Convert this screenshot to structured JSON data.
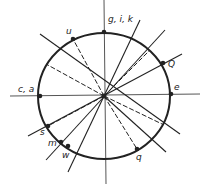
{
  "diagram": {
    "center": [
      104,
      96
    ],
    "radius_x": 66,
    "radius_y": 63,
    "colors": {
      "stroke": "#222222",
      "axis": "#555555",
      "background": "#ffffff"
    },
    "axes": [
      {
        "name": "horizontal-axis",
        "x1": 10,
        "y1": 96,
        "x2": 200,
        "y2": 94
      },
      {
        "name": "vertical-axis",
        "x1": 104,
        "y1": 0,
        "x2": 106,
        "y2": 184
      }
    ],
    "solid_lines": [
      {
        "name": "line-nw-se",
        "x1": 40,
        "y1": 34,
        "x2": 180,
        "y2": 134
      },
      {
        "name": "line-nne-ssw",
        "x1": 140,
        "y1": 20,
        "x2": 68,
        "y2": 172
      },
      {
        "name": "line-ne-sw",
        "x1": 182,
        "y1": 54,
        "x2": 28,
        "y2": 136
      },
      {
        "name": "line-ene",
        "x1": 165,
        "y1": 30,
        "x2": 46,
        "y2": 160
      },
      {
        "name": "line-se",
        "x1": 104,
        "y1": 96,
        "x2": 166,
        "y2": 152
      }
    ],
    "dashed_lines": [
      {
        "name": "dash-to-u",
        "x1": 104,
        "y1": 96,
        "x2": 73,
        "y2": 39
      },
      {
        "name": "dash-wnw",
        "x1": 104,
        "y1": 96,
        "x2": 46,
        "y2": 64
      },
      {
        "name": "dash-to-q",
        "x1": 104,
        "y1": 96,
        "x2": 137,
        "y2": 149
      },
      {
        "name": "dash-ese",
        "x1": 104,
        "y1": 96,
        "x2": 162,
        "y2": 124
      },
      {
        "name": "dash-nne",
        "x1": 104,
        "y1": 96,
        "x2": 150,
        "y2": 50
      },
      {
        "name": "dash-sw",
        "x1": 104,
        "y1": 96,
        "x2": 48,
        "y2": 126
      }
    ],
    "points": [
      {
        "label": "g, i, k",
        "x": 104,
        "y": 32,
        "lx": 108,
        "ly": 22
      },
      {
        "label": "u",
        "x": 73,
        "y": 39,
        "lx": 66,
        "ly": 34
      },
      {
        "label": "Q",
        "x": 163,
        "y": 63,
        "lx": 168,
        "ly": 67
      },
      {
        "label": "c, a",
        "x": 40,
        "y": 96,
        "lx": 18,
        "ly": 92
      },
      {
        "label": "e",
        "x": 171,
        "y": 94,
        "lx": 174,
        "ly": 90
      },
      {
        "label": "s",
        "x": 48,
        "y": 126,
        "lx": 40,
        "ly": 135
      },
      {
        "label": "m",
        "x": 61,
        "y": 142,
        "lx": 48,
        "ly": 146
      },
      {
        "label": "w",
        "x": 68,
        "y": 146,
        "lx": 62,
        "ly": 158
      },
      {
        "label": "q",
        "x": 137,
        "y": 149,
        "lx": 136,
        "ly": 160
      }
    ]
  }
}
